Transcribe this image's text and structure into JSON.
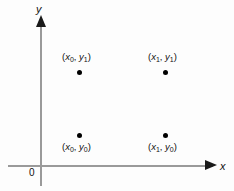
{
  "figure": {
    "type": "cartesian-point-diagram",
    "background_color": "#fdfdfd",
    "axis_color": "#9a9a9a",
    "marker_color": "#000000",
    "text_color": "#111111"
  },
  "axes": {
    "y_label": "y",
    "x_label": "x",
    "origin_label": "0",
    "y_arrow_direction": "up",
    "x_arrow_direction": "right"
  },
  "points": [
    {
      "id": "x0y1",
      "open_paren": "(",
      "x_var": "x",
      "x_sub": "0",
      "comma": ", ",
      "y_var": "y",
      "y_sub": "1",
      "close_paren": ")",
      "label_position": "above",
      "quadrant": "top-left"
    },
    {
      "id": "x1y1",
      "open_paren": "(",
      "x_var": "x",
      "x_sub": "1",
      "comma": ", ",
      "y_var": "y",
      "y_sub": "1",
      "close_paren": ")",
      "label_position": "above",
      "quadrant": "top-right"
    },
    {
      "id": "x0y0",
      "open_paren": "(",
      "x_var": "x",
      "x_sub": "0",
      "comma": ", ",
      "y_var": "y",
      "y_sub": "0",
      "close_paren": ")",
      "label_position": "below",
      "quadrant": "bottom-left"
    },
    {
      "id": "x1y0",
      "open_paren": "(",
      "x_var": "x",
      "x_sub": "1",
      "comma": ", ",
      "y_var": "y",
      "y_sub": "0",
      "close_paren": ")",
      "label_position": "below",
      "quadrant": "bottom-right"
    }
  ]
}
